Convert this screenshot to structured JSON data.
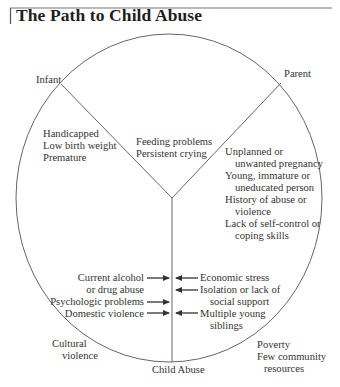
{
  "title": "The Path to Child Abuse",
  "colors": {
    "line": "#555555",
    "text": "#333333",
    "title": "#1e1e1e",
    "background": "#ffffff"
  },
  "nodes": {
    "infant": "Infant",
    "parent": "Parent",
    "outcome": "Child Abuse"
  },
  "segments": {
    "infant_factors": [
      "Handicapped",
      "Low birth weight",
      "Premature"
    ],
    "shared_factors": [
      "Feeding problems",
      "Persistent crying"
    ],
    "parent_factors": [
      "Unplanned or",
      "unwanted pregnancy",
      "Young, immature or",
      "uneducated person",
      "History of abuse or",
      "violence",
      "Lack of self-control or",
      "coping skills"
    ]
  },
  "triggers": {
    "left": [
      "Current alcohol",
      "or drug abuse",
      "Psychologic problems",
      "Domestic violence"
    ],
    "right": [
      "Economic stress",
      "Isolation or lack of",
      "social support",
      "Multiple young",
      "siblings"
    ]
  },
  "context": {
    "left": [
      "Cultural",
      "violence"
    ],
    "right": [
      "Poverty",
      "Few community",
      "resources"
    ]
  }
}
